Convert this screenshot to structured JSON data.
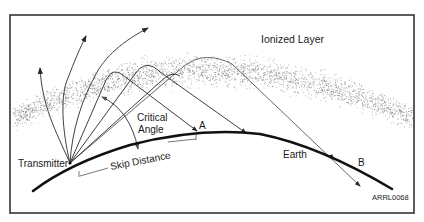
{
  "diagram": {
    "labels": {
      "ionized_layer": "Ionized Layer",
      "critical": "Critical",
      "angle": "Angle",
      "point_a": "A",
      "point_b": "B",
      "transmitter": "Transmitter",
      "skip_distance": "Skip Distance",
      "earth": "Earth",
      "figure_id": "ARRL0068"
    },
    "colors": {
      "line": "#2a2a2a",
      "earth": "#111111",
      "frame": "#333333",
      "layer_dots": "#6e6e6e"
    }
  }
}
